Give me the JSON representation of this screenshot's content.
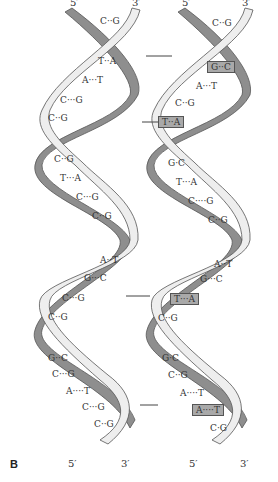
{
  "figure": {
    "panel_label": "B",
    "colors": {
      "strand_dark": "#8e8e8e",
      "strand_light": "#eeeeee",
      "strand_outline": "#555555",
      "highlight_box": "#a9a9a9"
    },
    "left_helix": {
      "top_labels": {
        "five_prime": "5′",
        "three_prime": "3′"
      },
      "bottom_labels": {
        "five_prime": "5′",
        "three_prime": "3′"
      },
      "base_pairs": [
        {
          "label": "C··G",
          "highlighted": false
        },
        {
          "label": "T··A",
          "highlighted": false
        },
        {
          "label": "A···T",
          "highlighted": false
        },
        {
          "label": "C···G",
          "highlighted": false
        },
        {
          "label": "C··G",
          "highlighted": false
        },
        {
          "label": "C··G",
          "highlighted": false
        },
        {
          "label": "T···A",
          "highlighted": false
        },
        {
          "label": "C···G",
          "highlighted": false
        },
        {
          "label": "C··G",
          "highlighted": false
        },
        {
          "label": "A··T",
          "highlighted": false
        },
        {
          "label": "G···C",
          "highlighted": false
        },
        {
          "label": "C···G",
          "highlighted": false
        },
        {
          "label": "C··G",
          "highlighted": false
        },
        {
          "label": "G··C",
          "highlighted": false
        },
        {
          "label": "C···G",
          "highlighted": false
        },
        {
          "label": "A····T",
          "highlighted": false
        },
        {
          "label": "C···G",
          "highlighted": false
        },
        {
          "label": "C··G",
          "highlighted": false
        }
      ]
    },
    "right_helix": {
      "top_labels": {
        "five_prime": "5′",
        "three_prime": "3′"
      },
      "bottom_labels": {
        "five_prime": "5′",
        "three_prime": "3′"
      },
      "base_pairs": [
        {
          "label": "C··G",
          "highlighted": false
        },
        {
          "label": "G··C",
          "highlighted": true
        },
        {
          "label": "A···T",
          "highlighted": false
        },
        {
          "label": "C··G",
          "highlighted": false
        },
        {
          "label": "T··A",
          "highlighted": true
        },
        {
          "label": "G·C",
          "highlighted": false
        },
        {
          "label": "T···A",
          "highlighted": false
        },
        {
          "label": "C····G",
          "highlighted": false
        },
        {
          "label": "C··G",
          "highlighted": false
        },
        {
          "label": "A··T",
          "highlighted": false
        },
        {
          "label": "G···C",
          "highlighted": false
        },
        {
          "label": "T···A",
          "highlighted": true
        },
        {
          "label": "C··G",
          "highlighted": false
        },
        {
          "label": "G·C",
          "highlighted": false
        },
        {
          "label": "C··G",
          "highlighted": false
        },
        {
          "label": "A····T",
          "highlighted": false
        },
        {
          "label": "A····T",
          "highlighted": true
        },
        {
          "label": "C·G",
          "highlighted": false
        }
      ]
    },
    "difference_markers": [
      {
        "y": 56,
        "note": "G·C substitution"
      },
      {
        "y": 122,
        "note": "T·A substitution"
      },
      {
        "y": 296,
        "note": "T·A substitution"
      },
      {
        "y": 405,
        "note": "A·T substitution"
      }
    ]
  }
}
